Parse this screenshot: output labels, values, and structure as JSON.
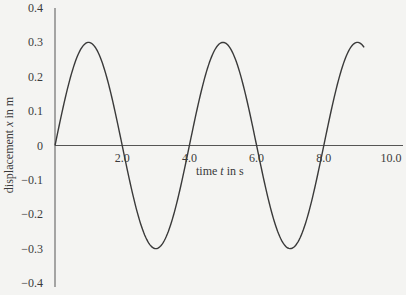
{
  "chart_data": {
    "type": "line",
    "title": "",
    "xlabel": "time t in s",
    "ylabel": "displacement x in m",
    "xlim": [
      0,
      10
    ],
    "ylim": [
      -0.4,
      0.4
    ],
    "grid": false,
    "legend": null,
    "x_ticks": [
      "2.0",
      "4.0",
      "6.0",
      "8.0",
      "10.0"
    ],
    "x_tick_values": [
      2,
      4,
      6,
      8,
      10
    ],
    "y_ticks": [
      "0.4",
      "0.3",
      "0.2",
      "0.1",
      "0",
      "-0.1",
      "-0.2",
      "-0.3",
      "-0.4"
    ],
    "y_tick_values": [
      0.4,
      0.3,
      0.2,
      0.1,
      0,
      -0.1,
      -0.2,
      -0.3,
      -0.4
    ],
    "series": [
      {
        "name": "displacement",
        "function": "x = 0.3 sin(2πt/4)",
        "amplitude": 0.3,
        "period": 4.0,
        "t_range": [
          0,
          9.2
        ],
        "x": [
          0,
          1,
          2,
          3,
          4,
          5,
          6,
          7,
          8,
          9,
          9.2
        ],
        "values": [
          0,
          0.3,
          0,
          -0.3,
          0,
          0.3,
          0,
          -0.3,
          0,
          0.3,
          0.29
        ],
        "color": "#3a3a3a"
      }
    ]
  },
  "labels": {
    "xlabel_prefix": "time ",
    "xlabel_var": "t",
    "xlabel_suffix": " in s",
    "ylabel_prefix": "displacement ",
    "ylabel_var": "x",
    "ylabel_suffix": " in m"
  }
}
